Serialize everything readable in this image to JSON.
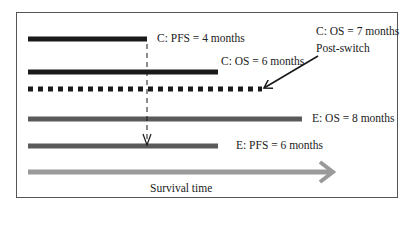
{
  "diagram": {
    "labels": {
      "c_pfs": "C: PFS = 4 months",
      "c_os": "C: OS = 6 months",
      "c_os_post": "C: OS = 7 months",
      "post_switch": "Post-switch",
      "e_os": "E: OS = 8 months",
      "e_pfs": "E: PFS = 6 months",
      "axis": "Survival time"
    },
    "colors": {
      "control": "#1a1a1a",
      "experimental": "#5a5a5a",
      "axis_arrow": "#9a9a9a"
    },
    "bars": [
      {
        "id": "c_pfs",
        "arm": "C",
        "endpoint": "PFS",
        "months": 4,
        "style": "solid"
      },
      {
        "id": "c_os",
        "arm": "C",
        "endpoint": "OS",
        "months": 6,
        "style": "solid"
      },
      {
        "id": "c_os_post",
        "arm": "C",
        "endpoint": "OS post-switch",
        "months": 7,
        "style": "dotted"
      },
      {
        "id": "e_os",
        "arm": "E",
        "endpoint": "OS",
        "months": 8,
        "style": "solid"
      },
      {
        "id": "e_pfs",
        "arm": "E",
        "endpoint": "PFS",
        "months": 6,
        "style": "solid"
      }
    ]
  }
}
